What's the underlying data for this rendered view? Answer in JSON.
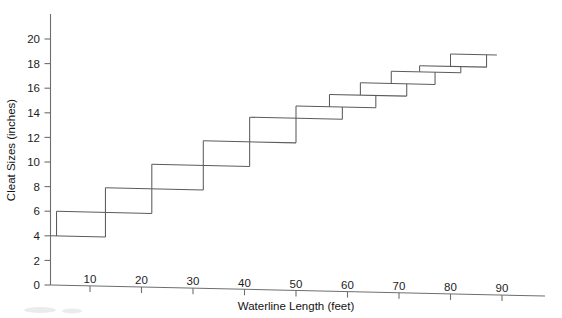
{
  "chart_data": {
    "type": "line",
    "title": "",
    "xlabel": "Waterline Length (feet)",
    "ylabel": "Cleat Sizes (inches)",
    "xlim": [
      0,
      95
    ],
    "ylim": [
      0,
      21
    ],
    "grid": false,
    "legend": "none",
    "x_ticks": [
      10,
      20,
      30,
      40,
      50,
      60,
      70,
      80,
      90
    ],
    "y_ticks": [
      0,
      2,
      4,
      6,
      8,
      10,
      12,
      14,
      16,
      18,
      20
    ],
    "series": [
      {
        "name": "Cleat size vs waterline length",
        "steps": [
          {
            "cleat_size": 4,
            "x_start": 0,
            "x_end": 13
          },
          {
            "cleat_size": 6,
            "x_start": 3.5,
            "x_end": 22
          },
          {
            "cleat_size": 8,
            "x_start": 13,
            "x_end": 32
          },
          {
            "cleat_size": 10,
            "x_start": 22,
            "x_end": 41
          },
          {
            "cleat_size": 12,
            "x_start": 32,
            "x_end": 50
          },
          {
            "cleat_size": 14,
            "x_start": 41,
            "x_end": 59
          },
          {
            "cleat_size": 15,
            "x_start": 50,
            "x_end": 65.5
          },
          {
            "cleat_size": 16,
            "x_start": 56.5,
            "x_end": 71.5
          },
          {
            "cleat_size": 17,
            "x_start": 62.5,
            "x_end": 77
          },
          {
            "cleat_size": 18,
            "x_start": 68.5,
            "x_end": 82
          },
          {
            "cleat_size": 18.5,
            "x_start": 74,
            "x_end": 87
          },
          {
            "cleat_size": 19.5,
            "x_start": 80,
            "x_end": 89
          }
        ]
      }
    ]
  },
  "axes": {
    "y_title": "Cleat Sizes (inches)",
    "x_title": "Waterline Length (feet)",
    "y_tick_labels": [
      "0",
      "2",
      "4",
      "6",
      "8",
      "10",
      "12",
      "14",
      "16",
      "18",
      "20"
    ],
    "x_tick_labels": [
      "10",
      "20",
      "30",
      "40",
      "50",
      "60",
      "70",
      "80",
      "90"
    ]
  },
  "style": {
    "background": "#ffffff",
    "line_color": "#5b5b5b",
    "axis_color": "#6e6e6e",
    "text_color": "#1d1d1d"
  }
}
